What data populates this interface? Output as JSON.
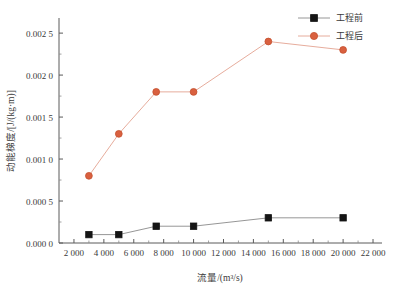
{
  "chart_data": {
    "type": "line",
    "title": "",
    "xlabel": "流量/(m³/s)",
    "ylabel": "动能梯度/[J/(kg·m)]",
    "xlim": [
      1000,
      22600
    ],
    "ylim": [
      0.0,
      0.00268
    ],
    "grid": false,
    "legend_position": "top-right",
    "xticks": [
      2000,
      4000,
      6000,
      8000,
      10000,
      12000,
      14000,
      16000,
      18000,
      20000,
      22000
    ],
    "xtick_labels": [
      "2 000",
      "4 000",
      "6 000",
      "8 000",
      "10 000",
      "12 000",
      "14 000",
      "16 000",
      "18 000",
      "20 000",
      "22 000"
    ],
    "yticks": [
      0.0,
      0.0005,
      0.001,
      0.0015,
      0.002,
      0.0025
    ],
    "ytick_labels": [
      "0.000 0",
      "0.000 5",
      "0.001 0",
      "0.001 5",
      "0.002 0",
      "0.002 5"
    ],
    "x": [
      3000,
      5000,
      7500,
      10000,
      15000,
      20000
    ],
    "series": [
      {
        "name": "工程前",
        "color": "#151515",
        "line_color": "#8a8a8a",
        "marker": "square",
        "values": [
          0.0001,
          0.0001,
          0.0002,
          0.0002,
          0.0003,
          0.0003
        ]
      },
      {
        "name": "工程后",
        "color": "#d9603f",
        "line_color": "#e3a391",
        "marker": "circle",
        "values": [
          0.0008,
          0.0013,
          0.0018,
          0.0018,
          0.0024,
          0.0023
        ]
      }
    ]
  },
  "legend": {
    "entries": [
      {
        "label": "工程前"
      },
      {
        "label": "工程后"
      }
    ]
  },
  "axes": {
    "x_title": "流量/(m³/s)",
    "y_title": "动能梯度/[J/(kg·m)]"
  }
}
